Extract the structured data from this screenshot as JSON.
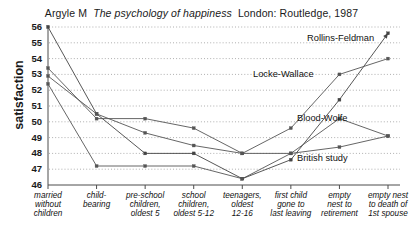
{
  "title": {
    "author": "Argyle M",
    "work": "The psychology of happiness",
    "publication": "London: Routledge, 1987",
    "full": "Argyle M  The psychology of happiness  London: Routledge, 1987"
  },
  "axis": {
    "ylabel": "satisfaction",
    "yticks": [
      "56",
      "55",
      "54",
      "53",
      "52",
      "51",
      "50",
      "49",
      "48",
      "47",
      "46"
    ]
  },
  "series_labels": [
    {
      "name": "Rollins-Feldman",
      "x": 307,
      "y": 33
    },
    {
      "name": "Locke-Wallace",
      "x": 253,
      "y": 69
    },
    {
      "name": "Blood-Wolfe",
      "x": 297,
      "y": 113
    },
    {
      "name": "British study",
      "x": 297,
      "y": 153
    }
  ],
  "xlabels": [
    {
      "lines": [
        "married",
        "without",
        "children"
      ]
    },
    {
      "lines": [
        "child-",
        "bearing"
      ]
    },
    {
      "lines": [
        "pre-school",
        "children,",
        "oldest 5"
      ]
    },
    {
      "lines": [
        "school",
        "children,",
        "oldest 5-12"
      ]
    },
    {
      "lines": [
        "teenagers,",
        "oldest",
        "12-16"
      ]
    },
    {
      "lines": [
        "first child",
        "gone to",
        "last leaving"
      ]
    },
    {
      "lines": [
        "empty",
        "nest to",
        "retirement"
      ]
    },
    {
      "lines": [
        "empty nest",
        "to death of",
        "1st spouse"
      ]
    }
  ],
  "chart_data": {
    "type": "line",
    "xlabel": "",
    "ylabel": "satisfaction",
    "ylim": [
      46,
      56
    ],
    "ytick_step": 1,
    "grid": true,
    "legend": "inline-right-labels",
    "categories": [
      "married without children",
      "child-bearing",
      "pre-school children, oldest 5",
      "school children, oldest 5-12",
      "teenagers, oldest 12-16",
      "first child gone to last leaving",
      "empty nest to retirement",
      "empty nest to death of 1st spouse"
    ],
    "series": [
      {
        "name": "Rollins-Feldman",
        "color": "#444444",
        "values": [
          56.0,
          50.5,
          48.0,
          48.0,
          46.4,
          47.6,
          51.4,
          55.6
        ],
        "arrow_end": true
      },
      {
        "name": "Locke-Wallace",
        "color": "#555555",
        "values": [
          53.4,
          50.2,
          50.2,
          49.6,
          48.0,
          49.6,
          53.0,
          54.0
        ]
      },
      {
        "name": "Blood-Wolfe",
        "color": "#555555",
        "values": [
          52.9,
          50.5,
          49.3,
          48.5,
          48.0,
          48.0,
          50.2,
          49.1
        ]
      },
      {
        "name": "British study",
        "color": "#555555",
        "values": [
          52.4,
          47.2,
          47.2,
          47.2,
          46.4,
          48.0,
          48.4,
          49.1
        ]
      }
    ]
  }
}
